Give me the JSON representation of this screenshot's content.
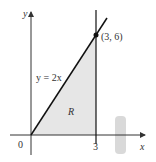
{
  "diagram": {
    "axes": {
      "x_label": "x",
      "y_label": "y"
    },
    "ticks": {
      "origin": "0",
      "x3": "3"
    },
    "line_label": "y = 2x",
    "point_label": "(3, 6)",
    "region_label": "R",
    "colors": {
      "shade": "#e6e6e6",
      "line": "#111111",
      "axis": "#333333",
      "thumb": "#c8c8c8"
    }
  }
}
